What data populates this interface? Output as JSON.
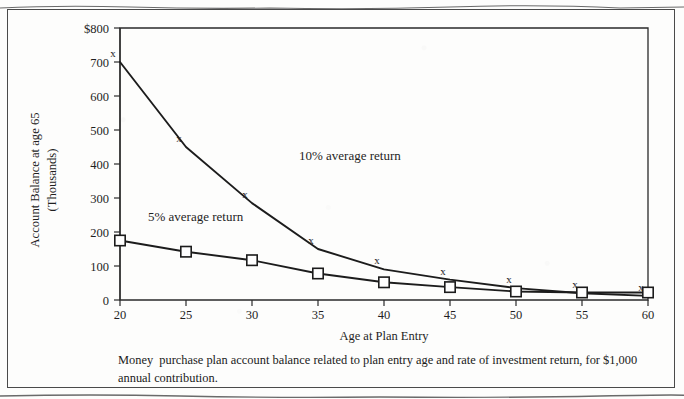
{
  "figure": {
    "caption": "Money  purchase plan account balance related to plan entry age and rate of investment return, for $1,000 annual contribution."
  },
  "chart_data": {
    "type": "line",
    "title": "",
    "xlabel": "Age at Plan Entry",
    "ylabel_line1": "Account Balance at age 65",
    "ylabel_line2": "(Thousands)",
    "x": [
      20,
      25,
      30,
      35,
      40,
      45,
      50,
      55,
      60
    ],
    "xtick_labels": [
      "20",
      "25",
      "30",
      "35",
      "40",
      "45",
      "50",
      "55",
      "60"
    ],
    "xlim": [
      20,
      60
    ],
    "ylim": [
      0,
      800
    ],
    "yticks": [
      0,
      100,
      200,
      300,
      400,
      500,
      600,
      700,
      800
    ],
    "ytick_labels": [
      "0",
      "100",
      "200",
      "300",
      "400",
      "500",
      "600",
      "700",
      "$800"
    ],
    "grid": false,
    "legend_position": "inline-annotation",
    "series": [
      {
        "name": "10% average return",
        "marker": "x",
        "annotation": "10% average return",
        "values": [
          700,
          450,
          285,
          150,
          90,
          60,
          35,
          20,
          12
        ]
      },
      {
        "name": "5% average return",
        "marker": "square",
        "annotation": "5% average return",
        "values": [
          175,
          142,
          117,
          78,
          52,
          38,
          25,
          22,
          22
        ]
      }
    ],
    "annotations": [
      {
        "text": "10% average return",
        "x": 37.0,
        "y": 400
      },
      {
        "text": "5% average return",
        "x": 24.5,
        "y": 215
      }
    ]
  }
}
